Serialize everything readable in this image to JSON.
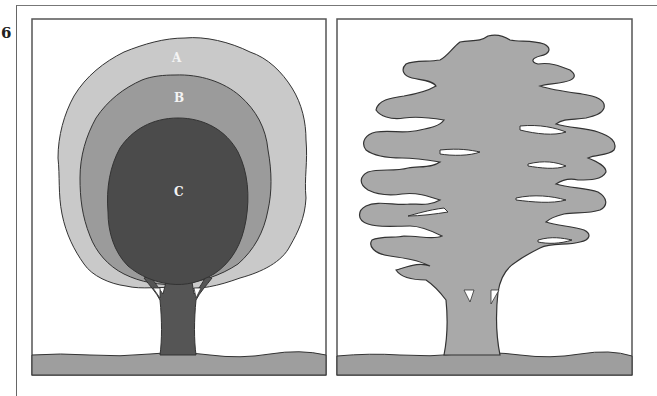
{
  "figure": {
    "number": "6",
    "panels": [
      {
        "id": "left",
        "description": "Tree crown shown as three nested zones",
        "zones": [
          {
            "label": "A",
            "color": "#c9c9c9"
          },
          {
            "label": "B",
            "color": "#9b9b9b"
          },
          {
            "label": "C",
            "color": "#4b4b4b"
          }
        ],
        "trunk_color": "#555555",
        "ground_color": "#9e9e9e"
      },
      {
        "id": "right",
        "description": "Tree silhouette with layered, irregular crown",
        "tree_color": "#a9a9a9",
        "ground_color": "#9e9e9e"
      }
    ],
    "colors": {
      "outline": "#333333",
      "frame": "#555555",
      "background": "#ffffff"
    }
  }
}
